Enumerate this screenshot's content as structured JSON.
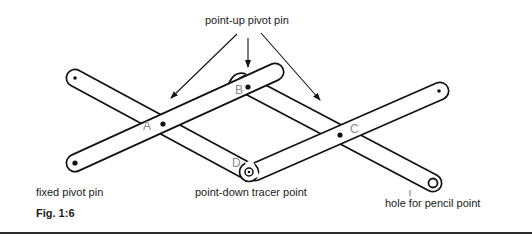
{
  "figure": {
    "caption": "Fig. 1:6",
    "labels": {
      "top": "point-up pivot pin",
      "fixed": "fixed pivot pin",
      "tracer": "point-down tracer point",
      "pencil": "hole for pencil point"
    },
    "pivots": [
      {
        "id": "A",
        "label": "A"
      },
      {
        "id": "B",
        "label": "B"
      },
      {
        "id": "C",
        "label": "C"
      },
      {
        "id": "D",
        "label": "D"
      }
    ],
    "colors": {
      "ink": "#111111",
      "pivot_letter": "#8a8a8a",
      "background": "#ffffff"
    }
  }
}
